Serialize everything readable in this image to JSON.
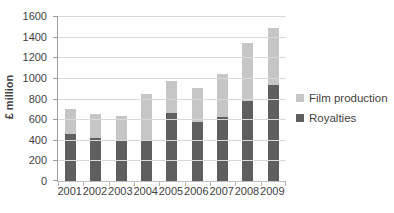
{
  "chart_data": {
    "type": "bar",
    "stacked": true,
    "title": "",
    "xlabel": "",
    "ylabel": "£ million",
    "ylim": [
      0,
      1600
    ],
    "yticks": [
      0,
      200,
      400,
      600,
      800,
      1000,
      1200,
      1400,
      1600
    ],
    "categories": [
      "2001",
      "2002",
      "2003",
      "2004",
      "2005",
      "2006",
      "2007",
      "2008",
      "2009"
    ],
    "series": [
      {
        "name": "Film production",
        "color": "#c6c6c6",
        "values": [
          240,
          230,
          240,
          450,
          310,
          330,
          420,
          560,
          550
        ]
      },
      {
        "name": "Royalties",
        "color": "#5f5f5f",
        "values": [
          460,
          420,
          390,
          390,
          660,
          570,
          620,
          780,
          930
        ]
      }
    ],
    "stack_order": "last-series-at-bottom",
    "legend_position": "right",
    "grid": true
  },
  "colors": {
    "background": "#ffffff",
    "gridline": "#d9d9d9",
    "y_axis": "#9e9e9e",
    "x_axis": "#bdbdbd",
    "text": "#3f3f3f"
  }
}
